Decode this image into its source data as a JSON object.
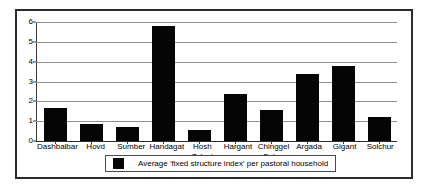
{
  "chart_data": {
    "type": "bar",
    "title": "",
    "xlabel": "",
    "ylabel": "",
    "ylim": [
      0,
      6
    ],
    "yticks": [
      0,
      1,
      2,
      3,
      4,
      5,
      6
    ],
    "grid": true,
    "legend_position": "bottom",
    "bar_color": "#050505",
    "categories": [
      "Dashbalbar",
      "Hovd",
      "Sumber",
      "Handagat",
      "Hosh Tolgoi",
      "Hargant",
      "Chinggel Bulag",
      "Argada",
      "Gigant",
      "Solchur"
    ],
    "category_lines": [
      [
        "Dashbalbar"
      ],
      [
        "Hovd"
      ],
      [
        "Sumber"
      ],
      [
        "Handagat"
      ],
      [
        "Hosh",
        "Tolgoi"
      ],
      [
        "Hargant"
      ],
      [
        "Chinggel",
        "Bulag"
      ],
      [
        "Argada"
      ],
      [
        "Gigant"
      ],
      [
        "Solchur"
      ]
    ],
    "series": [
      {
        "name": "Average 'fixed structure index' per pastoral household",
        "values": [
          1.65,
          0.85,
          0.7,
          5.8,
          0.55,
          2.35,
          1.55,
          3.4,
          3.8,
          1.2
        ]
      }
    ]
  },
  "legend": {
    "label": "Average 'fixed structure index' per pastoral household"
  }
}
